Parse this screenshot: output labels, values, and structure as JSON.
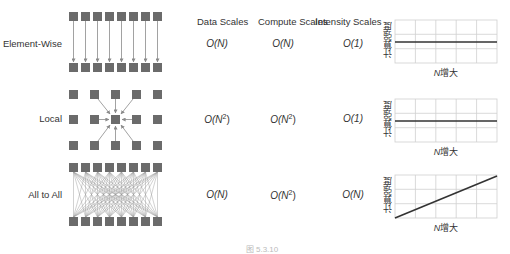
{
  "columns": {
    "data": "Data Scales",
    "compute": "Compute Scales",
    "intensity": "Intensity Scales"
  },
  "rows": [
    {
      "label": "Element-Wise",
      "data": "O(N)",
      "compute": "O(N)",
      "intensity": "O(1)",
      "data_sup": "",
      "compute_sup": "",
      "intensity_sup": ""
    },
    {
      "label": "Local",
      "data": "O(N",
      "compute": "O(N",
      "intensity": "O(1)",
      "data_sup": "2",
      "compute_sup": "2",
      "intensity_sup": ""
    },
    {
      "label": "All to All",
      "data": "O(N)",
      "compute": "O(N",
      "intensity": "O(N)",
      "data_sup": "",
      "compute_sup": "2",
      "intensity_sup": ""
    }
  ],
  "mini_charts": {
    "y_label": "计算强度",
    "x_label_var": "N",
    "x_label_text": "增大"
  },
  "caption": "图 5.3.10",
  "colors": {
    "square": "#6b6b6b",
    "arrow": "#8a8a8a",
    "grid": "#cfcfcf",
    "line": "#333333"
  },
  "chart_data": [
    {
      "type": "line",
      "title": "Element-Wise intensity",
      "xlabel": "N增大",
      "ylabel": "计算强度",
      "x": [
        0,
        1
      ],
      "y": [
        0.5,
        0.5
      ],
      "trend": "constant",
      "grid": true
    },
    {
      "type": "line",
      "title": "Local intensity",
      "xlabel": "N增大",
      "ylabel": "计算强度",
      "x": [
        0,
        1
      ],
      "y": [
        0.5,
        0.5
      ],
      "trend": "constant",
      "grid": true
    },
    {
      "type": "line",
      "title": "All to All intensity",
      "xlabel": "N增大",
      "ylabel": "计算强度",
      "x": [
        0,
        1
      ],
      "y": [
        0.0,
        0.95
      ],
      "trend": "linear increasing",
      "grid": true
    }
  ]
}
